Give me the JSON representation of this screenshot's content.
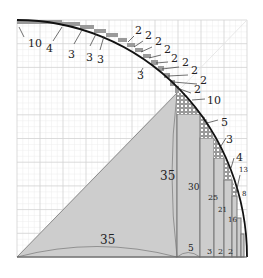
{
  "diagram": {
    "colors": {
      "background": "#ffffff",
      "grid_major": "#cfcfcf",
      "grid_minor": "#e8e8e8",
      "fill": "#cccccc",
      "arc": "#111111",
      "rect_edge": "#777777",
      "label": "#222222"
    },
    "top_arc_labels": [
      {
        "text": "10",
        "x": 28,
        "y": 47
      },
      {
        "text": "4",
        "x": 46,
        "y": 52
      },
      {
        "text": "3",
        "x": 68,
        "y": 58
      },
      {
        "text": "3",
        "x": 86,
        "y": 61
      },
      {
        "text": "3",
        "x": 97,
        "y": 63
      },
      {
        "text": "2",
        "x": 135,
        "y": 34
      },
      {
        "text": "2",
        "x": 145,
        "y": 39
      },
      {
        "text": "2",
        "x": 155,
        "y": 45
      },
      {
        "text": "2",
        "x": 164,
        "y": 53
      },
      {
        "text": "2",
        "x": 171,
        "y": 62
      },
      {
        "text": "2",
        "x": 182,
        "y": 66
      },
      {
        "text": "2",
        "x": 191,
        "y": 74
      },
      {
        "text": "2",
        "x": 200,
        "y": 84
      },
      {
        "text": "2",
        "x": 194,
        "y": 93
      },
      {
        "text": "3",
        "x": 137,
        "y": 79
      }
    ],
    "right_arc_labels": [
      {
        "text": "10",
        "x": 207,
        "y": 104
      },
      {
        "text": "5",
        "x": 221,
        "y": 126
      },
      {
        "text": "3",
        "x": 226,
        "y": 143
      },
      {
        "text": "4",
        "x": 236,
        "y": 161
      },
      {
        "text": "13",
        "x": 239,
        "y": 172,
        "small": true
      },
      {
        "text": "8",
        "x": 242,
        "y": 196,
        "small": true
      }
    ],
    "inner_labels": [
      {
        "text": "35",
        "x": 160,
        "y": 180,
        "size": 12
      },
      {
        "text": "35",
        "x": 100,
        "y": 244,
        "size": 12
      },
      {
        "text": "30",
        "x": 188,
        "y": 190,
        "size": 9
      },
      {
        "text": "25",
        "x": 208,
        "y": 200,
        "size": 8
      },
      {
        "text": "21",
        "x": 218,
        "y": 212,
        "size": 7
      },
      {
        "text": "16",
        "x": 228,
        "y": 222,
        "size": 7
      },
      {
        "text": "5",
        "x": 188,
        "y": 251,
        "size": 9
      },
      {
        "text": "3",
        "x": 207,
        "y": 254,
        "size": 8
      },
      {
        "text": "2",
        "x": 218,
        "y": 254,
        "size": 8
      },
      {
        "text": "2",
        "x": 228,
        "y": 254,
        "size": 8
      }
    ]
  }
}
